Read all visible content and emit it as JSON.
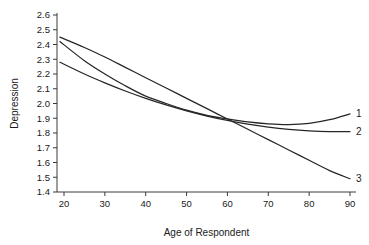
{
  "chart_data": {
    "type": "line",
    "title": "",
    "xlabel": "Age of Respondent",
    "ylabel": "Depression",
    "xlim": [
      19,
      90
    ],
    "ylim": [
      1.4,
      2.6
    ],
    "grid": false,
    "legend_position": "right-end-labels",
    "x_ticks": [
      20,
      30,
      40,
      50,
      60,
      70,
      80,
      90
    ],
    "x_tick_labels": [
      "20",
      "30",
      "40",
      "50",
      "60",
      "70",
      "80",
      "90"
    ],
    "y_ticks": [
      1.4,
      1.5,
      1.6,
      1.7,
      1.8,
      1.9,
      2.0,
      2.1,
      2.2,
      2.3,
      2.4,
      2.5,
      2.6
    ],
    "y_tick_labels": [
      "1.4",
      "1.5",
      "1.6",
      "1.7",
      "1.8",
      "1.9",
      "2.0",
      "2.1",
      "2.2",
      "2.3",
      "2.4",
      "2.5",
      "2.6"
    ],
    "x": [
      19,
      25,
      30,
      35,
      40,
      45,
      50,
      55,
      60,
      65,
      70,
      75,
      80,
      85,
      90
    ],
    "series": [
      {
        "name": "1",
        "label": "1",
        "color": "#262626",
        "values": [
          2.42,
          2.29,
          2.2,
          2.12,
          2.05,
          2.0,
          1.955,
          1.92,
          1.895,
          1.875,
          1.862,
          1.857,
          1.865,
          1.89,
          1.93
        ]
      },
      {
        "name": "2",
        "label": "2",
        "color": "#262626",
        "values": [
          2.28,
          2.2,
          2.14,
          2.085,
          2.035,
          1.99,
          1.95,
          1.915,
          1.885,
          1.86,
          1.84,
          1.825,
          1.815,
          1.81,
          1.81
        ]
      },
      {
        "name": "3",
        "label": "3",
        "color": "#262626",
        "values": [
          2.45,
          2.38,
          2.315,
          2.245,
          2.175,
          2.105,
          2.035,
          1.965,
          1.895,
          1.825,
          1.755,
          1.685,
          1.615,
          1.545,
          1.49
        ]
      }
    ],
    "series_end_labels": [
      {
        "label": "3",
        "value": 2.18
      },
      {
        "label": "1",
        "value": 1.93
      },
      {
        "label": "2",
        "value": 1.49
      }
    ],
    "annotations": []
  }
}
